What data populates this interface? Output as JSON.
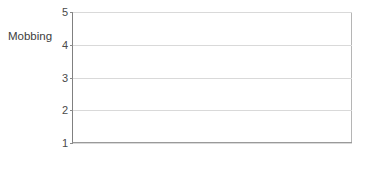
{
  "chart_data": {
    "type": "bar",
    "title": "",
    "xlabel": "",
    "ylabel": "Mobbing",
    "categories": [
      "Tag 2",
      "Tag 6"
    ],
    "series": [
      {
        "name": "Gefangene",
        "color": "#d2d2d2",
        "values": [
          1.15,
          2.3
        ]
      },
      {
        "name": "Wärter",
        "color": "#4b4b4b",
        "values": [
          1.45,
          3.45
        ]
      }
    ],
    "ylim": [
      1,
      5
    ],
    "yticks": [
      1,
      2,
      3,
      4,
      5
    ],
    "ytick_labels": [
      "1",
      "2",
      "3",
      "4",
      "5"
    ],
    "grid": true,
    "legend_position": "top-right"
  },
  "legend": {
    "items": [
      {
        "label": "Gefangene"
      },
      {
        "label": "Wärter"
      }
    ]
  },
  "axis": {
    "y_label": "Mobbing",
    "ticks": [
      "5",
      "4",
      "3",
      "2",
      "1"
    ]
  },
  "categories": [
    {
      "label": "Tag 2"
    },
    {
      "label": "Tag 6"
    }
  ]
}
